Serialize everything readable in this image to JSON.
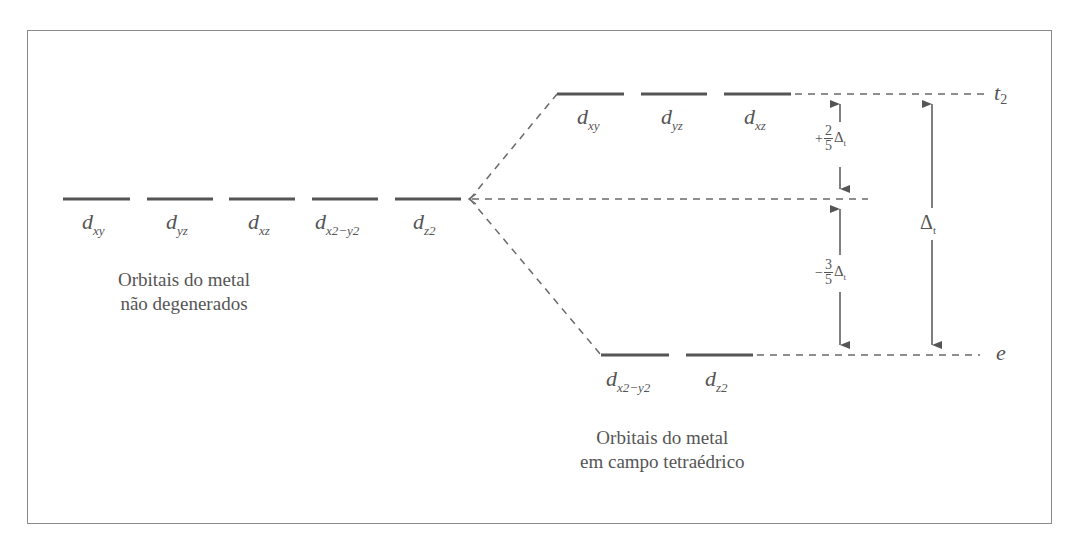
{
  "diagram": {
    "left_group": {
      "orbitals": [
        {
          "base": "d",
          "sub": "xy"
        },
        {
          "base": "d",
          "sub": "yz"
        },
        {
          "base": "d",
          "sub": "xz"
        },
        {
          "base": "d",
          "sub": "x2−y2"
        },
        {
          "base": "d",
          "sub": "z2"
        }
      ],
      "caption_line1": "Orbitais do metal",
      "caption_line2": "não degenerados"
    },
    "upper_group": {
      "orbitals": [
        {
          "base": "d",
          "sub": "xy"
        },
        {
          "base": "d",
          "sub": "yz"
        },
        {
          "base": "d",
          "sub": "xz"
        }
      ],
      "level_name": "t",
      "level_sub": "2"
    },
    "lower_group": {
      "orbitals": [
        {
          "base": "d",
          "sub": "x2−y2"
        },
        {
          "base": "d",
          "sub": "z2"
        }
      ],
      "level_name": "e",
      "caption_line1": "Orbitais do metal",
      "caption_line2": "em campo tetraédrico"
    },
    "energy_labels": {
      "upper_sign": "+",
      "upper_num": "2",
      "upper_den": "5",
      "lower_sign": "−",
      "lower_num": "3",
      "lower_den": "5",
      "delta_symbol": "Δ",
      "delta_sub": "t"
    },
    "colors": {
      "line": "#555555",
      "dash": "#6a6a6a",
      "frame": "#8a8a8a",
      "text": "#555555"
    }
  }
}
